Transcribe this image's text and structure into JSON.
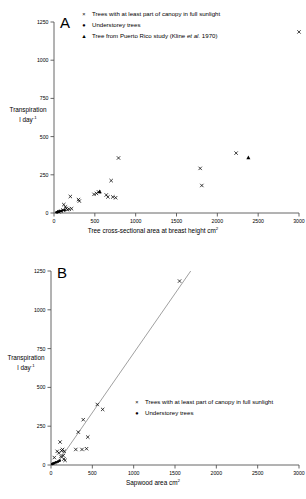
{
  "figure": {
    "background": "#ffffff",
    "ink": "#000000",
    "axis_color": "#555555"
  },
  "panels": [
    {
      "id": "A",
      "letter": "A",
      "axis": {
        "ylabel_line1": "Transpiration",
        "ylabel_line2": "l day",
        "ylabel_sup": "-1",
        "xlabel_main": "Tree cross-sectional area at breast height",
        "xlabel_unit": " cm",
        "xlabel_sup": "2",
        "yticks": [
          "0",
          "250",
          "500",
          "750",
          "1000",
          "1250"
        ],
        "ytick_values": [
          0,
          250,
          500,
          750,
          1000,
          1250
        ],
        "xticks": [
          "0",
          "500",
          "1000",
          "1500",
          "2000",
          "2500",
          "3000"
        ],
        "xtick_values": [
          0,
          500,
          1000,
          1500,
          2000,
          2500,
          3000
        ],
        "xlim": [
          0,
          3000
        ],
        "ylim": [
          0,
          1250
        ],
        "grid": false
      },
      "legend": {
        "position": "top-center",
        "entries": [
          {
            "marker": "x",
            "label": "Trees with at least part of canopy in full sunlight"
          },
          {
            "marker": "dot",
            "label": "Understorey trees"
          },
          {
            "marker": "triangle",
            "label_prefix": "Tree from Puerto Rico study (Kline ",
            "label_italic": "et al.",
            "label_suffix": " 1970)"
          }
        ]
      }
    },
    {
      "id": "B",
      "letter": "B",
      "axis": {
        "ylabel_line1": "Transpiration",
        "ylabel_line2": "l day",
        "ylabel_sup": "-1",
        "xlabel_main": "Sapwood area",
        "xlabel_unit": " cm",
        "xlabel_sup": "2",
        "yticks": [
          "0",
          "250",
          "500",
          "750",
          "1000",
          "1250"
        ],
        "ytick_values": [
          0,
          250,
          500,
          750,
          1000,
          1250
        ],
        "xticks": [
          "0",
          "500",
          "1000",
          "1500",
          "2000",
          "2500",
          "3000"
        ],
        "xtick_values": [
          0,
          500,
          1000,
          1500,
          2000,
          2500,
          3000
        ],
        "xlim": [
          0,
          3000
        ],
        "ylim": [
          0,
          1250
        ],
        "grid": false
      },
      "legend": {
        "position": "middle-right",
        "entries": [
          {
            "marker": "x",
            "label": "Trees with at least part of canopy in full sunlight"
          },
          {
            "marker": "dot",
            "label": "Understorey trees"
          }
        ]
      }
    }
  ],
  "chart_data": [
    {
      "type": "scatter",
      "panel": "A",
      "title": "A",
      "xlabel": "Tree cross-sectional area at breast height, cm2",
      "ylabel": "Transpiration l day-1",
      "xlim": [
        0,
        3000
      ],
      "ylim": [
        0,
        1250
      ],
      "grid": false,
      "legend_position": "top-center",
      "series": [
        {
          "name": "Trees with at least part of canopy in full sunlight",
          "marker": "x",
          "points": [
            [
              60,
              8
            ],
            [
              85,
              12
            ],
            [
              110,
              20
            ],
            [
              120,
              55
            ],
            [
              140,
              40
            ],
            [
              150,
              30
            ],
            [
              165,
              22
            ],
            [
              185,
              25
            ],
            [
              200,
              108
            ],
            [
              215,
              28
            ],
            [
              300,
              88
            ],
            [
              310,
              78
            ],
            [
              490,
              122
            ],
            [
              520,
              128
            ],
            [
              545,
              138
            ],
            [
              640,
              118
            ],
            [
              660,
              105
            ],
            [
              700,
              212
            ],
            [
              720,
              105
            ],
            [
              755,
              100
            ],
            [
              790,
              360
            ],
            [
              1790,
              292
            ],
            [
              1810,
              180
            ],
            [
              2230,
              392
            ],
            [
              3000,
              1185
            ]
          ]
        },
        {
          "name": "Understorey trees",
          "marker": "dot",
          "points": [
            [
              30,
              5
            ],
            [
              45,
              6
            ],
            [
              55,
              9
            ],
            [
              70,
              11
            ],
            [
              95,
              14
            ],
            [
              130,
              18
            ]
          ]
        },
        {
          "name": "Tree from Puerto Rico study (Kline et al. 1970)",
          "marker": "triangle",
          "points": [
            [
              560,
              140
            ],
            [
              2380,
              362
            ]
          ]
        }
      ]
    },
    {
      "type": "scatter",
      "panel": "B",
      "title": "B",
      "xlabel": "Sapwood area, cm2",
      "ylabel": "Transpiration l day-1",
      "xlim": [
        0,
        3000
      ],
      "ylim": [
        0,
        1250
      ],
      "grid": false,
      "legend_position": "middle-right",
      "trendline": {
        "x": [
          60,
          1690
        ],
        "y": [
          0,
          1250
        ],
        "style": "solid"
      },
      "series": [
        {
          "name": "Trees with at least part of canopy in full sunlight",
          "marker": "x",
          "points": [
            [
              40,
              48
            ],
            [
              75,
              88
            ],
            [
              95,
              78
            ],
            [
              110,
              148
            ],
            [
              120,
              55
            ],
            [
              130,
              92
            ],
            [
              140,
              100
            ],
            [
              148,
              60
            ],
            [
              155,
              38
            ],
            [
              160,
              88
            ],
            [
              170,
              30
            ],
            [
              300,
              100
            ],
            [
              330,
              212
            ],
            [
              375,
              100
            ],
            [
              390,
              292
            ],
            [
              430,
              105
            ],
            [
              445,
              180
            ],
            [
              560,
              390
            ],
            [
              625,
              358
            ],
            [
              1555,
              1185
            ]
          ]
        },
        {
          "name": "Understorey trees",
          "marker": "dot",
          "points": [
            [
              15,
              6
            ],
            [
              25,
              9
            ],
            [
              40,
              12
            ],
            [
              60,
              18
            ],
            [
              85,
              22
            ],
            [
              105,
              28
            ]
          ]
        }
      ]
    }
  ]
}
